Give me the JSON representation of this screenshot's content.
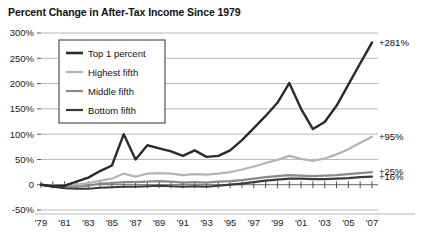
{
  "title": "Percent Change in After-Tax Income Since 1979",
  "chart_data": {
    "type": "line",
    "title": "Percent Change in After-Tax Income Since 1979",
    "xlabel": "",
    "ylabel": "",
    "ylim": [
      -50,
      300
    ],
    "xlim": [
      1979,
      2007
    ],
    "grid": true,
    "legend_position": "upper-left",
    "ytick_labels": [
      "300%",
      "250%",
      "200%",
      "150%",
      "100%",
      "50%",
      "0",
      "-50%"
    ],
    "ytick_values": [
      300,
      250,
      200,
      150,
      100,
      50,
      0,
      -50
    ],
    "xtick_labels": [
      "'79",
      "'81",
      "'83",
      "'85",
      "'87",
      "'89",
      "'91",
      "'93",
      "'95",
      "'97",
      "'99",
      "'01",
      "'03",
      "'05",
      "'07"
    ],
    "xtick_values": [
      1979,
      1981,
      1983,
      1985,
      1987,
      1989,
      1991,
      1993,
      1995,
      1997,
      1999,
      2001,
      2003,
      2005,
      2007
    ],
    "x": [
      1979,
      1980,
      1981,
      1982,
      1983,
      1984,
      1985,
      1986,
      1987,
      1988,
      1989,
      1990,
      1991,
      1992,
      1993,
      1994,
      1995,
      1996,
      1997,
      1998,
      1999,
      2000,
      2001,
      2002,
      2003,
      2004,
      2005,
      2006,
      2007
    ],
    "series": [
      {
        "name": "Top 1 percent",
        "color": "#2b2b2b",
        "width": 2.4,
        "end_label": "+281%",
        "end_value": 281,
        "values": [
          0,
          -3,
          -2,
          6,
          14,
          27,
          38,
          100,
          50,
          78,
          72,
          66,
          57,
          68,
          55,
          57,
          68,
          88,
          112,
          136,
          162,
          201,
          150,
          110,
          124,
          156,
          198,
          240,
          281
        ]
      },
      {
        "name": "Highest fifth",
        "color": "#b5b5b5",
        "width": 2.2,
        "end_label": "+95%",
        "end_value": 95,
        "values": [
          0,
          -2,
          -2,
          0,
          3,
          8,
          12,
          22,
          16,
          22,
          23,
          22,
          19,
          21,
          20,
          22,
          25,
          30,
          36,
          43,
          49,
          57,
          51,
          47,
          52,
          60,
          70,
          83,
          95
        ]
      },
      {
        "name": "Middle fifth",
        "color": "#8a8a8a",
        "width": 2.2,
        "end_label": "+25%",
        "end_value": 25,
        "values": [
          0,
          -3,
          -4,
          -4,
          -2,
          2,
          3,
          5,
          5,
          6,
          7,
          6,
          4,
          5,
          4,
          6,
          7,
          9,
          12,
          15,
          17,
          19,
          18,
          17,
          18,
          19,
          21,
          23,
          25
        ]
      },
      {
        "name": "Bottom fifth",
        "color": "#3a3a3a",
        "width": 2.2,
        "end_label": "+16%",
        "end_value": 16,
        "values": [
          0,
          -4,
          -7,
          -8,
          -8,
          -6,
          -5,
          -4,
          -4,
          -3,
          -2,
          -3,
          -4,
          -3,
          -4,
          -2,
          0,
          2,
          5,
          8,
          10,
          12,
          12,
          11,
          11,
          12,
          13,
          15,
          16
        ]
      }
    ],
    "legend": [
      {
        "label": "Top 1 percent",
        "color": "#2b2b2b"
      },
      {
        "label": "Highest fifth",
        "color": "#b5b5b5"
      },
      {
        "label": "Middle fifth",
        "color": "#8a8a8a"
      },
      {
        "label": "Bottom fifth",
        "color": "#3a3a3a"
      }
    ]
  }
}
